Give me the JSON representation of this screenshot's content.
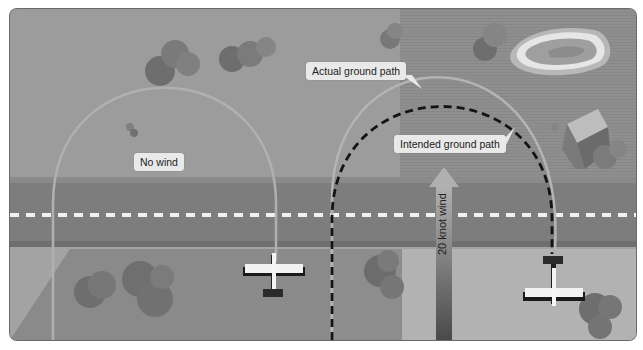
{
  "diagram": {
    "labels": {
      "no_wind": "No wind",
      "actual_ground_path": "Actual ground path",
      "intended_ground_path": "Intended ground path",
      "wind": "20 knot wind"
    },
    "elements": [
      {
        "name": "runway",
        "type": "road",
        "orientation": "horizontal",
        "centerline": "dashed-white"
      },
      {
        "name": "no-wind-path",
        "type": "semicircle",
        "style": "solid-light"
      },
      {
        "name": "actual-ground-path",
        "type": "arc",
        "style": "solid-light"
      },
      {
        "name": "intended-ground-path",
        "type": "semicircle",
        "style": "dashed-black"
      },
      {
        "name": "wind-arrow",
        "direction": "up",
        "value_knots": 20
      },
      {
        "name": "airplane-left",
        "heading": "north"
      },
      {
        "name": "airplane-right",
        "heading": "south"
      },
      {
        "name": "lake"
      },
      {
        "name": "house"
      },
      {
        "name": "trees"
      }
    ],
    "colors": {
      "background": "#8e8e8e",
      "light_field": "#a8a8a8",
      "runway": "#7f7f7f",
      "runway_edge": "#6e6e6e",
      "path_light": "#b0b0b0",
      "path_dashed": "#141414",
      "label_bg": "#e9e9e9",
      "tree": "#6f6f6f",
      "wind_arrow_top": "#a9a9a9",
      "wind_arrow_bottom": "#4a4a4a"
    }
  }
}
